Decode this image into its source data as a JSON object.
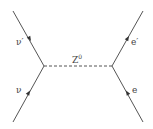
{
  "diagram": {
    "type": "feynman",
    "boson": {
      "label": "Z",
      "superscript": "0"
    },
    "particles": {
      "nu_in": {
        "label": "ν"
      },
      "nu_out": {
        "label": "ν′"
      },
      "e_in": {
        "label": "e"
      },
      "e_out": {
        "label": "e′"
      }
    },
    "line_color": "#555555"
  }
}
